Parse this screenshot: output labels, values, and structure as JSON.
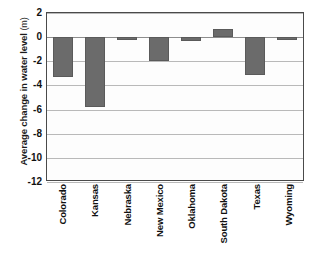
{
  "chart_data": {
    "type": "bar",
    "title": "",
    "subtitle": "",
    "xlabel": "",
    "ylabel": "Average change in water level",
    "ylabel_unit": "(m)",
    "ylabel_full": "Average change in water level (m)",
    "categories": [
      "Colorado",
      "Kansas",
      "Nebraska",
      "New Mexico",
      "Oklahoma",
      "South Dakota",
      "Texas",
      "Wyoming"
    ],
    "values": [
      -3.3,
      -5.8,
      -0.15,
      -2.0,
      -0.3,
      0.7,
      -3.1,
      -0.15
    ],
    "ylim": [
      -12,
      2
    ],
    "ytick_labels": [
      "2",
      "0",
      "-2",
      "-4",
      "-6",
      "-8",
      "-10",
      "-12"
    ],
    "ytick_values": [
      2,
      0,
      -2,
      -4,
      -6,
      -8,
      -10,
      -12
    ],
    "grid": true,
    "legend": false,
    "legend_position": "none",
    "bar_color": "#6b6b6b",
    "bar_edge_color": "#5a5a5a",
    "axis_color": "#4a4a4a",
    "grid_color": "#b9b9b9",
    "plot_background": "#fdfdfd",
    "page_background": "#ffffff"
  }
}
